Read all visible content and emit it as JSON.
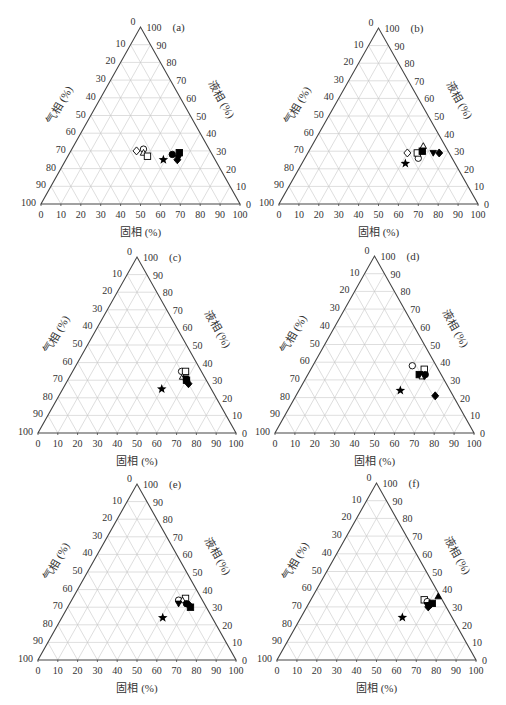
{
  "figure": {
    "axis_labels": {
      "bottom": "固相 (%)",
      "right": "液相 (%)",
      "left": "气相 (%)"
    },
    "ticks": [
      "0",
      "10",
      "20",
      "30",
      "40",
      "50",
      "60",
      "70",
      "80",
      "90",
      "100"
    ],
    "colors": {
      "axis": "#444444",
      "grid": "#c8c8c8",
      "marker": "#000000",
      "text": "#333333"
    }
  },
  "chart_data": [
    {
      "type": "ternary",
      "panel": "(a)",
      "axes": {
        "bottom": "固相 (%)",
        "right": "液相 (%)",
        "left": "气相 (%)"
      },
      "ticks": [
        0,
        10,
        20,
        30,
        40,
        50,
        60,
        70,
        80,
        90,
        100
      ],
      "grid": true,
      "geometry": {
        "left": 41,
        "right": 240,
        "base": 204,
        "apex": 27
      },
      "points": [
        {
          "marker": "diamond-open",
          "solid": 33,
          "liquid": 30,
          "gas": 37
        },
        {
          "marker": "circle-open",
          "solid": 36,
          "liquid": 31,
          "gas": 33
        },
        {
          "marker": "triangle-open",
          "solid": 37,
          "liquid": 29,
          "gas": 34
        },
        {
          "marker": "square-open",
          "solid": 40,
          "liquid": 27,
          "gas": 33
        },
        {
          "marker": "star",
          "solid": 49,
          "liquid": 25,
          "gas": 26
        },
        {
          "marker": "circle-filled",
          "solid": 52,
          "liquid": 28,
          "gas": 20
        },
        {
          "marker": "square-filled",
          "solid": 55,
          "liquid": 29,
          "gas": 16
        },
        {
          "marker": "triangle-down-filled",
          "solid": 56,
          "liquid": 26,
          "gas": 18
        },
        {
          "marker": "diamond-filled",
          "solid": 56,
          "liquid": 25,
          "gas": 19
        }
      ]
    },
    {
      "type": "ternary",
      "panel": "(b)",
      "axes": {
        "bottom": "固相 (%)",
        "right": "液相 (%)",
        "left": "气相 (%)"
      },
      "ticks": [
        0,
        10,
        20,
        30,
        40,
        50,
        60,
        70,
        80,
        90,
        100
      ],
      "grid": true,
      "geometry": {
        "left": 279,
        "right": 478,
        "base": 204,
        "apex": 28
      },
      "points": [
        {
          "marker": "diamond-open",
          "solid": 50,
          "liquid": 29,
          "gas": 21
        },
        {
          "marker": "circle-open",
          "solid": 57,
          "liquid": 26,
          "gas": 17
        },
        {
          "marker": "square-open",
          "solid": 55,
          "liquid": 29,
          "gas": 16
        },
        {
          "marker": "triangle-open",
          "solid": 56,
          "liquid": 33,
          "gas": 11
        },
        {
          "marker": "square-filled",
          "solid": 57,
          "liquid": 30,
          "gas": 13
        },
        {
          "marker": "triangle-down-filled",
          "solid": 63,
          "liquid": 29,
          "gas": 8
        },
        {
          "marker": "diamond-filled",
          "solid": 66,
          "liquid": 29,
          "gas": 5
        },
        {
          "marker": "star",
          "solid": 52,
          "liquid": 23,
          "gas": 25
        }
      ]
    },
    {
      "type": "ternary",
      "panel": "(c)",
      "axes": {
        "bottom": "固相 (%)",
        "right": "液相 (%)",
        "left": "气相 (%)"
      },
      "ticks": [
        0,
        10,
        20,
        30,
        40,
        50,
        60,
        70,
        80,
        90,
        100
      ],
      "grid": true,
      "geometry": {
        "left": 38,
        "right": 236,
        "base": 433,
        "apex": 257
      },
      "points": [
        {
          "marker": "circle-open",
          "solid": 55,
          "liquid": 35,
          "gas": 10
        },
        {
          "marker": "square-open",
          "solid": 57,
          "liquid": 35,
          "gas": 8
        },
        {
          "marker": "triangle-open",
          "solid": 57,
          "liquid": 32,
          "gas": 11
        },
        {
          "marker": "triangle-down-filled",
          "solid": 59,
          "liquid": 31,
          "gas": 10
        },
        {
          "marker": "circle-filled",
          "solid": 60,
          "liquid": 30,
          "gas": 10
        },
        {
          "marker": "square-filled",
          "solid": 60,
          "liquid": 30,
          "gas": 10
        },
        {
          "marker": "diamond-filled",
          "solid": 62,
          "liquid": 28,
          "gas": 10
        },
        {
          "marker": "star",
          "solid": 50,
          "liquid": 25,
          "gas": 25
        }
      ]
    },
    {
      "type": "ternary",
      "panel": "(d)",
      "axes": {
        "bottom": "固相 (%)",
        "right": "液相 (%)",
        "left": "气相 (%)"
      },
      "ticks": [
        0,
        10,
        20,
        30,
        40,
        50,
        60,
        70,
        80,
        90,
        100
      ],
      "grid": true,
      "geometry": {
        "left": 275,
        "right": 474,
        "base": 433,
        "apex": 256
      },
      "points": [
        {
          "marker": "circle-open",
          "solid": 50,
          "liquid": 38,
          "gas": 12
        },
        {
          "marker": "square-open",
          "solid": 57,
          "liquid": 36,
          "gas": 7
        },
        {
          "marker": "square-filled",
          "solid": 56,
          "liquid": 33,
          "gas": 11
        },
        {
          "marker": "circle-filled",
          "solid": 59,
          "liquid": 33,
          "gas": 8
        },
        {
          "marker": "triangle-open",
          "solid": 58,
          "liquid": 32,
          "gas": 10
        },
        {
          "marker": "triangle-down-filled",
          "solid": 59,
          "liquid": 32,
          "gas": 9
        },
        {
          "marker": "diamond-filled",
          "solid": 70,
          "liquid": 21,
          "gas": 9
        },
        {
          "marker": "star",
          "solid": 51,
          "liquid": 24,
          "gas": 25
        }
      ]
    },
    {
      "type": "ternary",
      "panel": "(e)",
      "axes": {
        "bottom": "固相 (%)",
        "right": "液相 (%)",
        "left": "气相 (%)"
      },
      "ticks": [
        0,
        10,
        20,
        30,
        40,
        50,
        60,
        70,
        80,
        90,
        100
      ],
      "grid": true,
      "geometry": {
        "left": 38,
        "right": 236,
        "base": 660,
        "apex": 484
      },
      "points": [
        {
          "marker": "circle-open",
          "solid": 54,
          "liquid": 34,
          "gas": 12
        },
        {
          "marker": "square-open",
          "solid": 57,
          "liquid": 35,
          "gas": 8
        },
        {
          "marker": "triangle-open",
          "solid": 56,
          "liquid": 34,
          "gas": 10
        },
        {
          "marker": "triangle-down-filled",
          "solid": 55,
          "liquid": 32,
          "gas": 13
        },
        {
          "marker": "circle-filled",
          "solid": 59,
          "liquid": 32,
          "gas": 9
        },
        {
          "marker": "diamond-filled",
          "solid": 61,
          "liquid": 31,
          "gas": 8
        },
        {
          "marker": "square-filled",
          "solid": 62,
          "liquid": 30,
          "gas": 8
        },
        {
          "marker": "star",
          "solid": 51,
          "liquid": 24,
          "gas": 25
        }
      ]
    },
    {
      "type": "ternary",
      "panel": "(f)",
      "axes": {
        "bottom": "固相 (%)",
        "right": "液相 (%)",
        "left": "气相 (%)"
      },
      "ticks": [
        0,
        10,
        20,
        30,
        40,
        50,
        60,
        70,
        80,
        90,
        100
      ],
      "grid": true,
      "geometry": {
        "left": 277,
        "right": 476,
        "base": 660,
        "apex": 483
      },
      "points": [
        {
          "marker": "square-open",
          "solid": 57,
          "liquid": 34,
          "gas": 9
        },
        {
          "marker": "circle-open",
          "solid": 59,
          "liquid": 33,
          "gas": 8
        },
        {
          "marker": "triangle-down-filled",
          "solid": 60,
          "liquid": 31,
          "gas": 9
        },
        {
          "marker": "circle-filled",
          "solid": 61,
          "liquid": 31,
          "gas": 8
        },
        {
          "marker": "diamond-filled",
          "solid": 61,
          "liquid": 30,
          "gas": 9
        },
        {
          "marker": "square-filled",
          "solid": 62,
          "liquid": 32,
          "gas": 6
        },
        {
          "marker": "triangle-filled",
          "solid": 63,
          "liquid": 36,
          "gas": 1
        },
        {
          "marker": "star",
          "solid": 51,
          "liquid": 24,
          "gas": 25
        }
      ]
    }
  ]
}
